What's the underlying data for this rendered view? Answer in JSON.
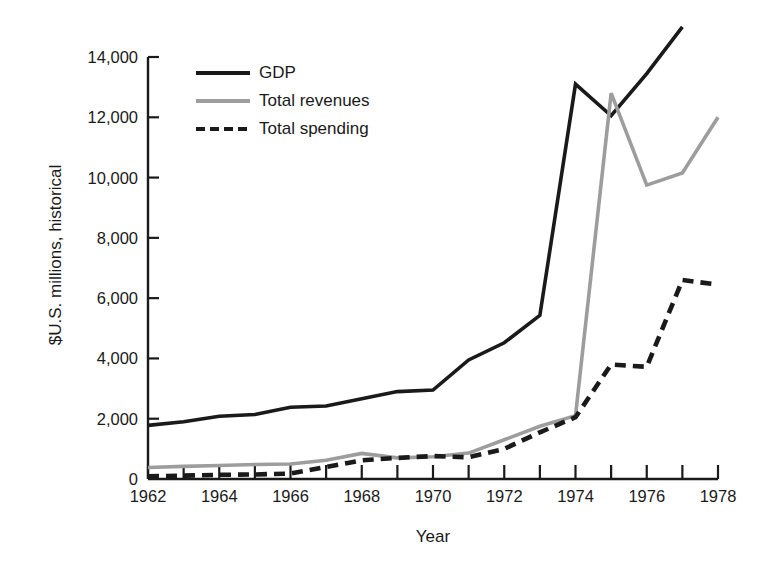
{
  "chart_data": {
    "type": "line",
    "title": "",
    "xlabel": "Year",
    "ylabel": "$U.S. millions, historical",
    "xlim": [
      1962,
      1978
    ],
    "ylim": [
      0,
      14000
    ],
    "grid": false,
    "legend_position": "top-left inside plot",
    "x_tick_labels": [
      "1962",
      "1964",
      "1966",
      "1968",
      "1970",
      "1972",
      "1974",
      "1976",
      "1978"
    ],
    "x_major_ticks": [
      1962,
      1964,
      1966,
      1968,
      1970,
      1972,
      1974,
      1976,
      1978
    ],
    "x_minor_ticks": [
      1963,
      1965,
      1967,
      1969,
      1971,
      1973,
      1975,
      1977
    ],
    "y_tick_labels": [
      "0",
      "2,000",
      "4,000",
      "6,000",
      "8,000",
      "10,000",
      "12,000",
      "14,000"
    ],
    "y_ticks": [
      0,
      2000,
      4000,
      6000,
      8000,
      10000,
      12000,
      14000
    ],
    "x": [
      1962,
      1963,
      1964,
      1965,
      1966,
      1967,
      1968,
      1969,
      1970,
      1971,
      1972,
      1973,
      1974,
      1975,
      1976,
      1977,
      1978
    ],
    "series": [
      {
        "name": "GDP",
        "color": "#1a1a1a",
        "style": "solid",
        "values": [
          1780,
          1900,
          2080,
          2140,
          2380,
          2420,
          2660,
          2900,
          2950,
          3950,
          4520,
          5430,
          13100,
          12050,
          13450,
          15000,
          null
        ]
      },
      {
        "name": "Total revenues",
        "color": "#9d9d9d",
        "style": "solid",
        "values": [
          380,
          420,
          450,
          480,
          500,
          620,
          850,
          700,
          740,
          860,
          1300,
          1750,
          2100,
          12800,
          9750,
          10150,
          12000
        ]
      },
      {
        "name": "Total spending",
        "color": "#1a1a1a",
        "style": "dashed",
        "values": [
          90,
          110,
          140,
          150,
          180,
          400,
          620,
          700,
          760,
          720,
          1000,
          1550,
          2050,
          3800,
          3720,
          6600,
          6450
        ]
      }
    ]
  },
  "axes": {
    "xlabel": "Year",
    "ylabel": "$U.S. millions, historical"
  },
  "legend": {
    "items": [
      {
        "label": "GDP",
        "swatch": "solid-black-line-icon"
      },
      {
        "label": "Total revenues",
        "swatch": "solid-gray-line-icon"
      },
      {
        "label": "Total spending",
        "swatch": "dashed-black-line-icon"
      }
    ]
  }
}
